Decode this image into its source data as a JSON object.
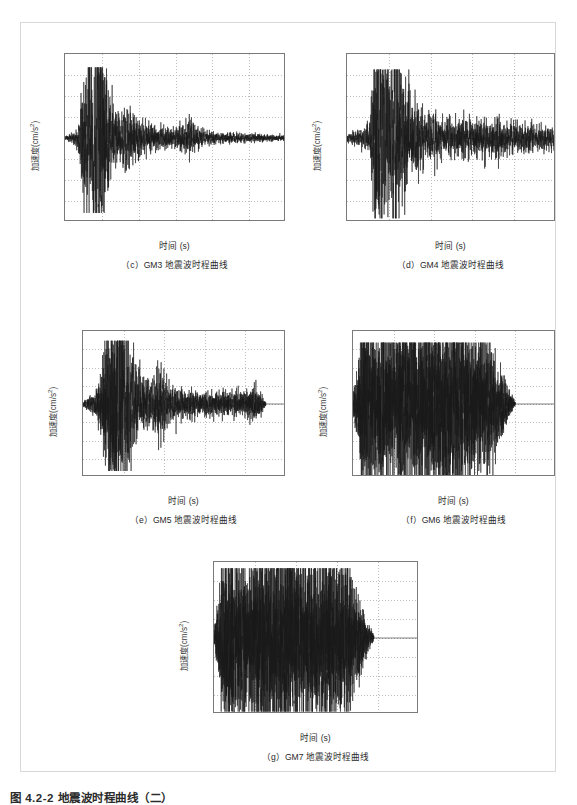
{
  "figure": {
    "caption": "图 4.2-2  地震波时程曲线（二）"
  },
  "axis_common": {
    "ylabel": "加速度(cm/s",
    "ylabel_sup": "2",
    "ylabel_tail": ")",
    "xlabel": "时间 (s)",
    "yticks": [
      "80",
      "60",
      "40",
      "20",
      "0",
      "-20",
      "-40",
      "-60",
      "-80"
    ],
    "ytick_values": [
      80,
      60,
      40,
      20,
      0,
      -20,
      -40,
      -60,
      -80
    ],
    "ylim": [
      -80,
      80
    ]
  },
  "panels": [
    {
      "id": "c",
      "caption": "（c）GM3 地震波时程曲线",
      "xticks": [
        "0",
        "10",
        "20",
        "30",
        "40",
        "50",
        "60"
      ],
      "xtick_values": [
        0,
        10,
        20,
        30,
        40,
        50,
        60
      ],
      "xlim": [
        0,
        60
      ]
    },
    {
      "id": "d",
      "caption": "（d）GM4 地震波时程曲线",
      "xticks": [
        "0",
        "10",
        "20",
        "30",
        "40",
        "50"
      ],
      "xtick_values": [
        0,
        10,
        20,
        30,
        40,
        50
      ],
      "xlim": [
        0,
        50
      ]
    },
    {
      "id": "e",
      "caption": "（e）GM5 地震波时程曲线",
      "xticks": [
        "0",
        "10",
        "20",
        "30",
        "40",
        "50"
      ],
      "xtick_values": [
        0,
        10,
        20,
        30,
        40,
        50
      ],
      "xlim": [
        0,
        50
      ]
    },
    {
      "id": "f",
      "caption": "（f）GM6 地震波时程曲线",
      "xticks": [
        "0",
        "10",
        "20",
        "30",
        "40",
        "50"
      ],
      "xtick_values": [
        0,
        10,
        20,
        30,
        40,
        50
      ],
      "xlim": [
        0,
        50
      ]
    },
    {
      "id": "g",
      "caption": "（g）GM7 地震波时程曲线",
      "xticks": [
        "0",
        "10",
        "20",
        "30",
        "40",
        "50"
      ],
      "xtick_values": [
        0,
        10,
        20,
        30,
        40,
        50
      ],
      "xlim": [
        0,
        50
      ]
    }
  ],
  "chart_data": [
    {
      "type": "line",
      "name": "GM3",
      "title": "（c）GM3 地震波时程曲线",
      "xlabel": "时间 (s)",
      "ylabel": "加速度(cm/s2)",
      "xlim": [
        0,
        60
      ],
      "ylim": [
        -80,
        80
      ],
      "xticks": [
        0,
        10,
        20,
        30,
        40,
        50,
        60
      ],
      "yticks": [
        -80,
        -60,
        -40,
        -20,
        0,
        20,
        40,
        60,
        80
      ],
      "grid": true,
      "legend": "none",
      "duration_s": 60,
      "peak_positive": 66,
      "peak_negative": -70,
      "strong_motion_window_s": [
        4,
        13
      ],
      "envelope": [
        {
          "t": 0,
          "a": 1.5
        },
        {
          "t": 2,
          "a": 3
        },
        {
          "t": 3.5,
          "a": 6
        },
        {
          "t": 5,
          "a": 30
        },
        {
          "t": 6,
          "a": 45
        },
        {
          "t": 7,
          "a": 52
        },
        {
          "t": 8,
          "a": 58
        },
        {
          "t": 9,
          "a": 62
        },
        {
          "t": 10,
          "a": 68
        },
        {
          "t": 11,
          "a": 40
        },
        {
          "t": 12,
          "a": 22
        },
        {
          "t": 13,
          "a": 16
        },
        {
          "t": 15,
          "a": 14
        },
        {
          "t": 17,
          "a": 18
        },
        {
          "t": 19,
          "a": 12
        },
        {
          "t": 22,
          "a": 9
        },
        {
          "t": 26,
          "a": 7
        },
        {
          "t": 30,
          "a": 6
        },
        {
          "t": 34,
          "a": 9
        },
        {
          "t": 38,
          "a": 4
        },
        {
          "t": 44,
          "a": 3
        },
        {
          "t": 50,
          "a": 2.5
        },
        {
          "t": 56,
          "a": 2
        },
        {
          "t": 60,
          "a": 1.5
        }
      ]
    },
    {
      "type": "line",
      "name": "GM4",
      "title": "（d）GM4 地震波时程曲线",
      "xlabel": "时间 (s)",
      "ylabel": "加速度(cm/s2)",
      "xlim": [
        0,
        50
      ],
      "ylim": [
        -80,
        80
      ],
      "xticks": [
        0,
        10,
        20,
        30,
        40,
        50
      ],
      "yticks": [
        -80,
        -60,
        -40,
        -20,
        0,
        20,
        40,
        60,
        80
      ],
      "grid": true,
      "legend": "none",
      "duration_s": 50,
      "peak_positive": 64,
      "peak_negative": -75,
      "strong_motion_window_s": [
        6,
        15
      ],
      "envelope": [
        {
          "t": 0,
          "a": 2
        },
        {
          "t": 2,
          "a": 4
        },
        {
          "t": 4,
          "a": 6
        },
        {
          "t": 5.5,
          "a": 12
        },
        {
          "t": 6.5,
          "a": 42
        },
        {
          "t": 7.5,
          "a": 64
        },
        {
          "t": 8.5,
          "a": 48
        },
        {
          "t": 9.5,
          "a": 52
        },
        {
          "t": 10.5,
          "a": 46
        },
        {
          "t": 11.5,
          "a": 70
        },
        {
          "t": 12.5,
          "a": 40
        },
        {
          "t": 14,
          "a": 26
        },
        {
          "t": 16,
          "a": 20
        },
        {
          "t": 18,
          "a": 16
        },
        {
          "t": 20,
          "a": 14
        },
        {
          "t": 23,
          "a": 10
        },
        {
          "t": 26,
          "a": 11
        },
        {
          "t": 30,
          "a": 10
        },
        {
          "t": 34,
          "a": 12
        },
        {
          "t": 38,
          "a": 9
        },
        {
          "t": 42,
          "a": 8
        },
        {
          "t": 46,
          "a": 7
        },
        {
          "t": 50,
          "a": 6
        }
      ]
    },
    {
      "type": "line",
      "name": "GM5",
      "title": "（e）GM5 地震波时程曲线",
      "xlabel": "时间 (s)",
      "ylabel": "加速度(cm/s2)",
      "xlim": [
        0,
        50
      ],
      "ylim": [
        -80,
        80
      ],
      "xticks": [
        0,
        10,
        20,
        30,
        40,
        50
      ],
      "yticks": [
        -80,
        -60,
        -40,
        -20,
        0,
        20,
        40,
        60,
        80
      ],
      "grid": true,
      "legend": "none",
      "duration_s": 45,
      "peak_positive": 68,
      "peak_negative": -72,
      "strong_motion_window_s": [
        5,
        14
      ],
      "envelope": [
        {
          "t": 0,
          "a": 2
        },
        {
          "t": 1.5,
          "a": 5
        },
        {
          "t": 3,
          "a": 8
        },
        {
          "t": 4.5,
          "a": 20
        },
        {
          "t": 5.5,
          "a": 48
        },
        {
          "t": 6.5,
          "a": 58
        },
        {
          "t": 7.5,
          "a": 66
        },
        {
          "t": 8.5,
          "a": 62
        },
        {
          "t": 9.5,
          "a": 70
        },
        {
          "t": 10.5,
          "a": 52
        },
        {
          "t": 11.5,
          "a": 44
        },
        {
          "t": 13,
          "a": 30
        },
        {
          "t": 15,
          "a": 18
        },
        {
          "t": 17,
          "a": 14
        },
        {
          "t": 18.5,
          "a": 26
        },
        {
          "t": 20,
          "a": 22
        },
        {
          "t": 22,
          "a": 12
        },
        {
          "t": 25,
          "a": 10
        },
        {
          "t": 28,
          "a": 9
        },
        {
          "t": 31,
          "a": 8
        },
        {
          "t": 34,
          "a": 9
        },
        {
          "t": 37,
          "a": 8
        },
        {
          "t": 40,
          "a": 9
        },
        {
          "t": 42.5,
          "a": 12
        },
        {
          "t": 44,
          "a": 6
        },
        {
          "t": 45,
          "a": 2
        }
      ]
    },
    {
      "type": "line",
      "name": "GM6",
      "title": "（f）GM6 地震波时程曲线",
      "xlabel": "时间 (s)",
      "ylabel": "加速度(cm/s2)",
      "xlim": [
        0,
        50
      ],
      "ylim": [
        -80,
        80
      ],
      "xticks": [
        0,
        10,
        20,
        30,
        40,
        50
      ],
      "yticks": [
        -80,
        -60,
        -40,
        -20,
        0,
        20,
        40,
        60,
        80
      ],
      "grid": true,
      "legend": "none",
      "duration_s": 40,
      "peak_positive": 66,
      "peak_negative": -78,
      "strong_motion_window_s": [
        2,
        36
      ],
      "envelope": [
        {
          "t": 0,
          "a": 6
        },
        {
          "t": 1,
          "a": 24
        },
        {
          "t": 2,
          "a": 48
        },
        {
          "t": 4,
          "a": 56
        },
        {
          "t": 6,
          "a": 50
        },
        {
          "t": 8,
          "a": 58
        },
        {
          "t": 10,
          "a": 54
        },
        {
          "t": 12,
          "a": 60
        },
        {
          "t": 14,
          "a": 52
        },
        {
          "t": 16,
          "a": 56
        },
        {
          "t": 18,
          "a": 62
        },
        {
          "t": 20,
          "a": 54
        },
        {
          "t": 22,
          "a": 58
        },
        {
          "t": 24,
          "a": 66
        },
        {
          "t": 26,
          "a": 52
        },
        {
          "t": 28,
          "a": 56
        },
        {
          "t": 30,
          "a": 48
        },
        {
          "t": 32,
          "a": 44
        },
        {
          "t": 34,
          "a": 36
        },
        {
          "t": 36,
          "a": 24
        },
        {
          "t": 38,
          "a": 12
        },
        {
          "t": 39.5,
          "a": 4
        },
        {
          "t": 40,
          "a": 1
        }
      ]
    },
    {
      "type": "line",
      "name": "GM7",
      "title": "（g）GM7 地震波时程曲线",
      "xlabel": "时间 (s)",
      "ylabel": "加速度(cm/s2)",
      "xlim": [
        0,
        50
      ],
      "ylim": [
        -80,
        80
      ],
      "xticks": [
        0,
        10,
        20,
        30,
        40,
        50
      ],
      "yticks": [
        -80,
        -60,
        -40,
        -20,
        0,
        20,
        40,
        60,
        80
      ],
      "grid": true,
      "legend": "none",
      "duration_s": 39,
      "peak_positive": 72,
      "peak_negative": -76,
      "strong_motion_window_s": [
        1,
        35
      ],
      "envelope": [
        {
          "t": 0,
          "a": 4
        },
        {
          "t": 1,
          "a": 26
        },
        {
          "t": 2,
          "a": 52
        },
        {
          "t": 4,
          "a": 60
        },
        {
          "t": 6,
          "a": 54
        },
        {
          "t": 8,
          "a": 50
        },
        {
          "t": 10,
          "a": 58
        },
        {
          "t": 12,
          "a": 62
        },
        {
          "t": 14,
          "a": 56
        },
        {
          "t": 16,
          "a": 60
        },
        {
          "t": 18,
          "a": 66
        },
        {
          "t": 20,
          "a": 58
        },
        {
          "t": 22,
          "a": 54
        },
        {
          "t": 24,
          "a": 60
        },
        {
          "t": 26,
          "a": 56
        },
        {
          "t": 28,
          "a": 62
        },
        {
          "t": 30,
          "a": 52
        },
        {
          "t": 32,
          "a": 46
        },
        {
          "t": 34,
          "a": 34
        },
        {
          "t": 36,
          "a": 20
        },
        {
          "t": 37.5,
          "a": 10
        },
        {
          "t": 39,
          "a": 2
        }
      ]
    }
  ]
}
